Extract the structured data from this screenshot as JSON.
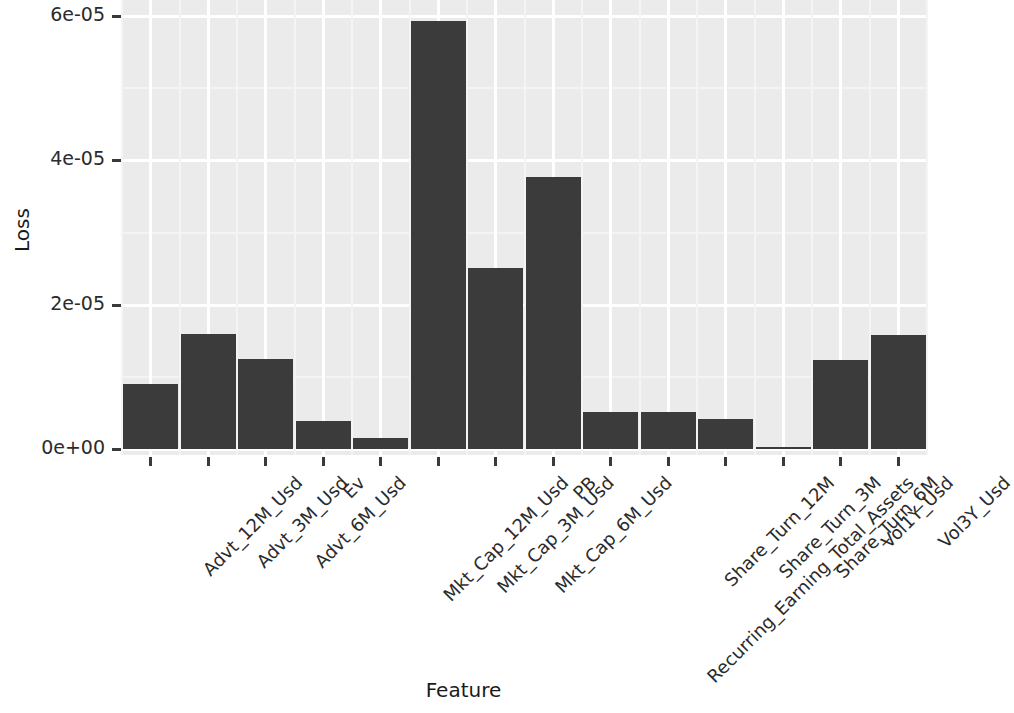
{
  "chart_data": {
    "type": "bar",
    "title": "",
    "xlabel": "Feature",
    "ylabel": "Loss",
    "categories": [
      "Advt_12M_Usd",
      "Advt_3M_Usd",
      "Advt_6M_Usd",
      "Ev",
      "Mkt_Cap_12M_Usd",
      "Mkt_Cap_3M_Usd",
      "Mkt_Cap_6M_Usd",
      "PB",
      "Recurring_Earning_Total_Assets",
      "Share_Turn_12M",
      "Share_Turn_3M",
      "Share_Turn_6M",
      "Vol1Y_Usd",
      "Vol3Y_Usd"
    ],
    "values": [
      9e-06,
      1.6e-05,
      1.25e-05,
      3.9e-06,
      1.5e-06,
      5.93e-05,
      2.51e-05,
      3.77e-05,
      5.1e-06,
      5.1e-06,
      4.2e-06,
      2e-07,
      1.23e-05,
      1.58e-05
    ],
    "ylim": [
      0,
      6.28e-05
    ],
    "ytick_values": [
      0,
      2e-05,
      4e-05,
      6e-05
    ],
    "ytick_labels": [
      "0e+00",
      "2e-05",
      "4e-05",
      "6e-05"
    ],
    "grid": true,
    "legend": false,
    "bar_color": "#3b3b3b",
    "panel_color": "#ebebeb",
    "grid_color": "#ffffff"
  },
  "ghost_text": {
    "rows": [
      "in w and P  i  r  Hist Lon i    Mt rea   rem   t CS s hen",
      "W       r    il  ty  Ch  da    rel Ta n Sh  20 2 Tard tyl  Usseq s",
      "W tr ki  ed d  i  en ra tio   in  et   m   th Hoz d    Ho mn n",
      "   n t r ve    an  sel    a n    Lal           sca li",
      "",
      "        tr  c   ls     Tealoa",
      "                       pr    fi rile    ag n",
      "",
      "        ar  s el i  e      ans   ma  tie",
      "          on  e       s  fl sm  urisd  g fin  re  Fagina",
      "          sa  t                  s   p  ef ng"
    ]
  }
}
